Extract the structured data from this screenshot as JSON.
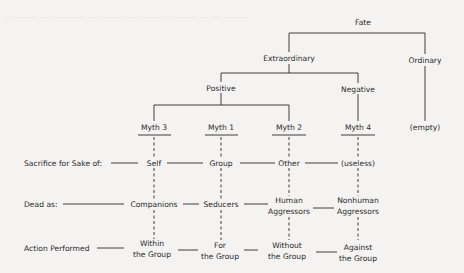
{
  "diagram": {
    "title_node": "Fate",
    "level1": {
      "left": "Extraordinary",
      "right": "Ordinary"
    },
    "level2": {
      "left": "Positive",
      "right": "Negative"
    },
    "myths": [
      "Myth 3",
      "Myth 1",
      "Myth 2",
      "Myth 4"
    ],
    "ordinary_leaf": "(empty)",
    "rows": [
      {
        "label": "Sacrifice for Sake of:",
        "values": [
          "Self",
          "Group",
          "Other",
          "(useless)"
        ]
      },
      {
        "label": "Dead as:",
        "values": [
          "Companions",
          "Seducers",
          "Human\nAggressors",
          "Nonhuman\nAggressors"
        ],
        "lines": [
          [
            "Companions"
          ],
          [
            "Seducers"
          ],
          [
            "Human",
            "Aggressors"
          ],
          [
            "Nonhuman",
            "Aggressors"
          ]
        ]
      },
      {
        "label": "Action Performed",
        "values": [
          "Within\nthe Group",
          "For\nthe Group",
          "Without\nthe Group",
          "Against\nthe Group"
        ],
        "lines": [
          [
            "Within",
            "the Group"
          ],
          [
            "For",
            "the Group"
          ],
          [
            "Without",
            "the Group"
          ],
          [
            "Against",
            "the Group"
          ]
        ]
      }
    ],
    "colors": {
      "ink": "#2a2a2a",
      "paper": "#f4f3f1",
      "bleed_text": "#e6e5e2"
    }
  }
}
